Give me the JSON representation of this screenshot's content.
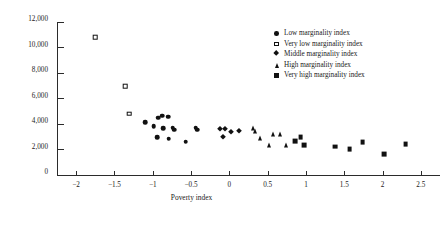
{
  "chart_data": {
    "type": "scatter",
    "title": "",
    "xlabel": "Poverty index",
    "ylabel": "GDP per capita (1995 pesos)",
    "xlim": [
      -2.25,
      2.75
    ],
    "ylim": [
      0,
      12000
    ],
    "xticks": [
      -2,
      -1.5,
      -1,
      -0.5,
      0,
      0.5,
      1,
      1.5,
      2,
      2.5
    ],
    "xticklabels": [
      "−2",
      "−1.5",
      "−1",
      "−0.5",
      "0",
      "0.5",
      "1",
      "1.5",
      "2",
      "2.5"
    ],
    "yticks": [
      0,
      2000,
      4000,
      6000,
      8000,
      10000,
      12000
    ],
    "yticklabels": [
      "0",
      "2,000",
      "4,000",
      "6,000",
      "8,000",
      "10,000",
      "12,000"
    ],
    "grid": false,
    "legend_position": "upper right",
    "series": [
      {
        "name": "Low marginality index",
        "marker": "circle-filled",
        "points": [
          [
            -1.1,
            4150
          ],
          [
            -0.93,
            4480
          ],
          [
            -0.88,
            4650
          ],
          [
            -0.8,
            4560
          ],
          [
            -0.99,
            3850
          ],
          [
            -0.86,
            3680
          ],
          [
            -0.74,
            3720
          ],
          [
            -0.72,
            3560
          ],
          [
            -0.94,
            2980
          ],
          [
            -0.79,
            2850
          ],
          [
            -0.57,
            2620
          ],
          [
            -0.44,
            3700
          ],
          [
            -0.42,
            3540
          ]
        ]
      },
      {
        "name": "Very low marginality index",
        "marker": "square-open",
        "points": [
          [
            -1.75,
            10800
          ],
          [
            -1.36,
            6950
          ],
          [
            -1.31,
            4800
          ]
        ]
      },
      {
        "name": "Middle marginality index",
        "marker": "diamond-filled",
        "points": [
          [
            -0.12,
            3580
          ],
          [
            -0.06,
            3620
          ],
          [
            0.02,
            3380
          ],
          [
            -0.08,
            2950
          ],
          [
            0.12,
            3450
          ]
        ]
      },
      {
        "name": "High marginality index",
        "marker": "triangle-filled",
        "points": [
          [
            0.31,
            3680
          ],
          [
            0.34,
            3480
          ],
          [
            0.4,
            2880
          ],
          [
            0.57,
            3180
          ],
          [
            0.66,
            3180
          ],
          [
            0.52,
            2380
          ],
          [
            0.74,
            2380
          ]
        ]
      },
      {
        "name": "Very high marginality index",
        "marker": "square-filled",
        "points": [
          [
            0.93,
            2950
          ],
          [
            0.86,
            2640
          ],
          [
            0.98,
            2340
          ],
          [
            1.38,
            2220
          ],
          [
            1.57,
            2030
          ],
          [
            1.74,
            2600
          ],
          [
            2.02,
            1650
          ],
          [
            2.3,
            2400
          ]
        ]
      }
    ]
  }
}
